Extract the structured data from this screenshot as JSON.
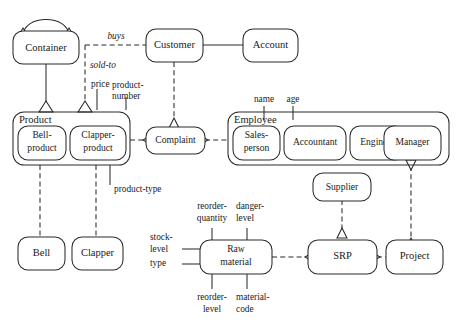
{
  "diagram": {
    "type": "entity-relationship-diagram",
    "width": 457,
    "height": 331,
    "background": "#ffffff",
    "stroke_color": "#2b2b2b",
    "entities": {
      "container": "Container",
      "customer": "Customer",
      "account": "Account",
      "product_group": "Product",
      "bell_product_l1": "Bell-",
      "bell_product_l2": "product",
      "clapper_product_l1": "Clapper-",
      "clapper_product_l2": "product",
      "complaint": "Complaint",
      "employee_group": "Employee",
      "salesperson_l1": "Sales-",
      "salesperson_l2": "person",
      "accountant": "Accountant",
      "engineer": "Engineer",
      "manager": "Manager",
      "bell": "Bell",
      "clapper": "Clapper",
      "raw_material_l1": "Raw",
      "raw_material_l2": "material",
      "supplier": "Supplier",
      "srp": "SRP",
      "project": "Project"
    },
    "relationship_labels": {
      "buys": "buys",
      "sold_to": "sold-to"
    },
    "attributes": {
      "price": "price",
      "product_number_l1": "product-",
      "product_number_l2": "number",
      "product_type": "product-type",
      "name": "name",
      "age": "age",
      "reorder_quantity_l1": "reorder-",
      "reorder_quantity_l2": "quantity",
      "danger_level_l1": "danger-",
      "danger_level_l2": "level",
      "stock_level_l1": "stock-",
      "stock_level_l2": "level",
      "type": "type",
      "reorder_level_l1": "reorder-",
      "reorder_level_l2": "level",
      "material_code_l1": "material-",
      "material_code_l2": "code"
    }
  }
}
